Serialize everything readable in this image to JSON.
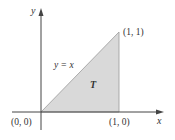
{
  "diagram": {
    "axes": {
      "x_label": "x",
      "y_label": "y"
    },
    "region": {
      "label": "T",
      "fill": "#d9d9d9",
      "vertices": [
        [
          0,
          0
        ],
        [
          1,
          0
        ],
        [
          1,
          1
        ]
      ]
    },
    "line": {
      "label": "y = x"
    },
    "points": {
      "origin": "(0, 0)",
      "p10": "(1, 0)",
      "p11": "(1, 1)"
    },
    "colors": {
      "axis": "#444444",
      "edge": "#888888",
      "fill": "#d9d9d9"
    }
  }
}
